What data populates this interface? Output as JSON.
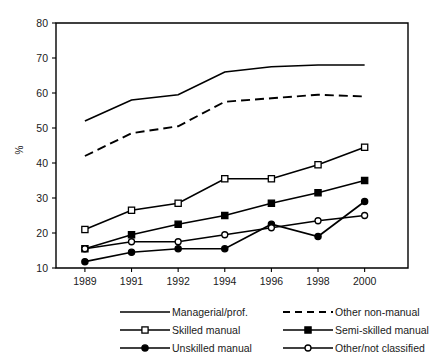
{
  "chart_data": {
    "type": "line",
    "title": "",
    "xlabel": "",
    "ylabel": "%",
    "categories": [
      "1989",
      "1991",
      "1992",
      "1994",
      "1996",
      "1998",
      "2000"
    ],
    "ylim": [
      10,
      80
    ],
    "yticks": [
      10,
      20,
      30,
      40,
      50,
      60,
      70,
      80
    ],
    "grid": false,
    "legend_position": "bottom",
    "series": [
      {
        "name": "Managerial/prof.",
        "style": "solid",
        "marker": "none",
        "values": [
          52,
          58,
          59.5,
          66,
          67.5,
          68,
          68
        ]
      },
      {
        "name": "Other non-manual",
        "style": "dashed",
        "marker": "none",
        "values": [
          42,
          48.5,
          50.5,
          57.5,
          58.5,
          59.5,
          59
        ]
      },
      {
        "name": "Skilled manual",
        "style": "solid",
        "marker": "open-square",
        "values": [
          21,
          26.5,
          28.5,
          35.5,
          35.5,
          39.5,
          44.5
        ]
      },
      {
        "name": "Semi-skilled manual",
        "style": "solid",
        "marker": "filled-square",
        "values": [
          15.5,
          19.5,
          22.5,
          25,
          28.5,
          31.5,
          35
        ]
      },
      {
        "name": "Unskilled manual",
        "style": "solid",
        "marker": "filled-circle",
        "values": [
          11.8,
          14.5,
          15.5,
          15.5,
          22.5,
          19,
          29
        ]
      },
      {
        "name": "Other/not classified",
        "style": "solid",
        "marker": "open-circle",
        "values": [
          15.5,
          17.5,
          17.5,
          19.5,
          21.5,
          23.5,
          25
        ]
      }
    ]
  },
  "axis": {
    "y_label": "%",
    "y_ticks": [
      "80",
      "70",
      "60",
      "50",
      "40",
      "30",
      "20",
      "10"
    ],
    "x_ticks": [
      "1989",
      "1991",
      "1992",
      "1994",
      "1996",
      "1998",
      "2000"
    ]
  },
  "legend": {
    "entries": [
      {
        "label": "Managerial/prof.",
        "marker": "none",
        "style": "solid"
      },
      {
        "label": "Other non-manual",
        "marker": "none",
        "style": "dashed"
      },
      {
        "label": "Skilled manual",
        "marker": "open-square",
        "style": "solid"
      },
      {
        "label": "Semi-skilled manual",
        "marker": "filled-square",
        "style": "solid"
      },
      {
        "label": "Unskilled manual",
        "marker": "filled-circle",
        "style": "solid"
      },
      {
        "label": "Other/not classified",
        "marker": "open-circle",
        "style": "solid"
      }
    ]
  },
  "colors": {
    "ink": "#000000",
    "background": "#ffffff"
  }
}
